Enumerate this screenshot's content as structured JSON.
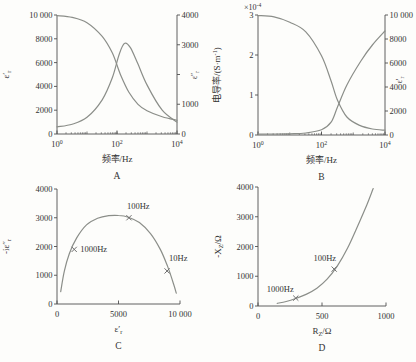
{
  "figure": {
    "background": "#fdfdfb",
    "curve_color": "#8b8e89",
    "axis_color": "#4f4f4f",
    "text_color": "#333333",
    "marker_color": "#6e6e6e"
  },
  "chart_data": [
    {
      "id": "A",
      "type": "line",
      "caption": "A",
      "x_axis": {
        "scale": "log",
        "min": 1,
        "max": 10000,
        "title": "频率/Hz",
        "ticks": [
          {
            "v": 1,
            "t": "10^{0}"
          },
          {
            "v": 100,
            "t": "10^{2}"
          },
          {
            "v": 10000,
            "t": "10^{4}"
          }
        ]
      },
      "y_left": {
        "min": 0,
        "max": 10000,
        "title": "ε′_{r}",
        "ticks": [
          {
            "v": 0,
            "t": "0"
          },
          {
            "v": 2000,
            "t": "2000"
          },
          {
            "v": 4000,
            "t": "4000"
          },
          {
            "v": 6000,
            "t": "6000"
          },
          {
            "v": 8000,
            "t": "8000"
          },
          {
            "v": 10000,
            "t": "10 000"
          }
        ]
      },
      "y_right": {
        "min": 0,
        "max": 4000,
        "title": "ε″_{r}",
        "ticks": [
          {
            "v": 0,
            "t": "0"
          },
          {
            "v": 1000,
            "t": "1000"
          },
          {
            "v": 2000,
            "t": ""
          },
          {
            "v": 3000,
            "t": "3000"
          },
          {
            "v": 4000,
            "t": "4000"
          }
        ]
      },
      "series": [
        {
          "name": "ε′_r",
          "axis": "left",
          "points": [
            [
              1,
              9950
            ],
            [
              3.2,
              9800
            ],
            [
              10,
              9350
            ],
            [
              32,
              8200
            ],
            [
              70,
              6800
            ],
            [
              130,
              5000
            ],
            [
              250,
              3500
            ],
            [
              500,
              2500
            ],
            [
              1000,
              1950
            ],
            [
              3200,
              1450
            ],
            [
              10000,
              1150
            ]
          ]
        },
        {
          "name": "ε″_r",
          "axis": "right",
          "points": [
            [
              1,
              240
            ],
            [
              3.2,
              330
            ],
            [
              10,
              560
            ],
            [
              32,
              1150
            ],
            [
              70,
              1900
            ],
            [
              120,
              2700
            ],
            [
              180,
              3050
            ],
            [
              280,
              2900
            ],
            [
              500,
              2350
            ],
            [
              1000,
              1650
            ],
            [
              3200,
              800
            ],
            [
              10000,
              400
            ]
          ]
        }
      ],
      "markers": []
    },
    {
      "id": "B",
      "type": "line",
      "caption": "B",
      "x_axis": {
        "scale": "log",
        "min": 1,
        "max": 10000,
        "title": "频率/Hz",
        "ticks": [
          {
            "v": 1,
            "t": "10^{0}"
          },
          {
            "v": 100,
            "t": "10^{2}"
          },
          {
            "v": 10000,
            "t": "10^{4}"
          }
        ]
      },
      "y_left": {
        "min": 0,
        "max": 3,
        "title": "电导率/(S·m^{-1})",
        "multiplier": "×10^{-4}",
        "ticks": [
          {
            "v": 0,
            "t": "0"
          },
          {
            "v": 1,
            "t": "1"
          },
          {
            "v": 2,
            "t": "2"
          },
          {
            "v": 3,
            "t": "3"
          }
        ]
      },
      "y_right": {
        "min": 0,
        "max": 10000,
        "title": "ε′_{r}",
        "ticks": [
          {
            "v": 0,
            "t": "0"
          },
          {
            "v": 2000,
            "t": "2000"
          },
          {
            "v": 4000,
            "t": "4000"
          },
          {
            "v": 6000,
            "t": "6000"
          },
          {
            "v": 8000,
            "t": "8000"
          },
          {
            "v": 10000,
            "t": "10 000"
          }
        ]
      },
      "series": [
        {
          "name": "电导率",
          "axis": "left",
          "points": [
            [
              1,
              0.02
            ],
            [
              10,
              0.03
            ],
            [
              32,
              0.05
            ],
            [
              100,
              0.13
            ],
            [
              200,
              0.32
            ],
            [
              320,
              0.7
            ],
            [
              630,
              1.25
            ],
            [
              1740,
              1.85
            ],
            [
              4000,
              2.25
            ],
            [
              10000,
              2.6
            ]
          ]
        },
        {
          "name": "ε′_r",
          "axis": "right",
          "points": [
            [
              1,
              9950
            ],
            [
              3.2,
              9850
            ],
            [
              10,
              9400
            ],
            [
              32,
              8600
            ],
            [
              100,
              6600
            ],
            [
              200,
              4500
            ],
            [
              320,
              2900
            ],
            [
              630,
              1500
            ],
            [
              1600,
              800
            ],
            [
              4000,
              500
            ],
            [
              10000,
              400
            ]
          ]
        }
      ],
      "markers": []
    },
    {
      "id": "C",
      "type": "line",
      "caption": "C",
      "x_axis": {
        "scale": "linear",
        "min": 0,
        "max": 10000,
        "title": "ε′_{r}",
        "ticks": [
          {
            "v": 0,
            "t": "0"
          },
          {
            "v": 5000,
            "t": "5000"
          },
          {
            "v": 10000,
            "t": "10 000"
          }
        ]
      },
      "y_left": {
        "min": 0,
        "max": 4000,
        "title": "-iε″_{r}",
        "ticks": [
          {
            "v": 0,
            "t": "0"
          },
          {
            "v": 1000,
            "t": "1000"
          },
          {
            "v": 2000,
            "t": "2000"
          },
          {
            "v": 3000,
            "t": "3000"
          },
          {
            "v": 4000,
            "t": "4000"
          }
        ]
      },
      "series": [
        {
          "name": "Cole-Cole",
          "axis": "left",
          "points": [
            [
              300,
              430
            ],
            [
              600,
              1150
            ],
            [
              1000,
              1750
            ],
            [
              1600,
              2300
            ],
            [
              2400,
              2750
            ],
            [
              3300,
              2980
            ],
            [
              4200,
              3070
            ],
            [
              5000,
              3080
            ],
            [
              5800,
              3020
            ],
            [
              6700,
              2830
            ],
            [
              7600,
              2450
            ],
            [
              8400,
              1900
            ],
            [
              9000,
              1300
            ],
            [
              9400,
              800
            ],
            [
              9700,
              380
            ]
          ]
        }
      ],
      "markers": [
        {
          "x": 1400,
          "y": 1900,
          "label": "1000Hz",
          "anchor": "start",
          "dx": 6,
          "dy": 3
        },
        {
          "x": 5850,
          "y": 3000,
          "label": "100Hz",
          "anchor": "start",
          "dx": -2,
          "dy": -9
        },
        {
          "x": 8950,
          "y": 1150,
          "label": "10Hz",
          "anchor": "start",
          "dx": 2,
          "dy": -10
        }
      ]
    },
    {
      "id": "D",
      "type": "line",
      "caption": "D",
      "x_axis": {
        "scale": "linear",
        "min": 0,
        "max": 1000,
        "title": "R_{Z}/Ω",
        "ticks": [
          {
            "v": 0,
            "t": "0"
          },
          {
            "v": 500,
            "t": "500"
          },
          {
            "v": 1000,
            "t": "1000"
          }
        ]
      },
      "y_left": {
        "min": 0,
        "max": 4000,
        "title": "-X_{Z}/Ω",
        "ticks": [
          {
            "v": 0,
            "t": "0"
          },
          {
            "v": 1000,
            "t": "1000"
          },
          {
            "v": 2000,
            "t": "2000"
          },
          {
            "v": 3000,
            "t": "3000"
          },
          {
            "v": 4000,
            "t": "4000"
          }
        ]
      },
      "series": [
        {
          "name": "impedance",
          "axis": "left",
          "points": [
            [
              150,
              90
            ],
            [
              220,
              150
            ],
            [
              300,
              260
            ],
            [
              380,
              400
            ],
            [
              460,
              600
            ],
            [
              540,
              900
            ],
            [
              620,
              1350
            ],
            [
              700,
              1950
            ],
            [
              780,
              2700
            ],
            [
              850,
              3400
            ],
            [
              900,
              3950
            ]
          ]
        }
      ],
      "markers": [
        {
          "x": 295,
          "y": 265,
          "label": "1000Hz",
          "anchor": "end",
          "dx": -2,
          "dy": -6
        },
        {
          "x": 595,
          "y": 1240,
          "label": "100Hz",
          "anchor": "end",
          "dx": 2,
          "dy": -8
        }
      ]
    }
  ]
}
